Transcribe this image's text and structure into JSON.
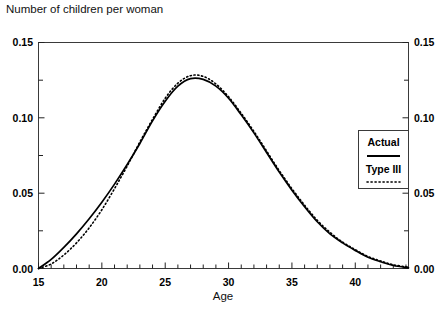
{
  "chart_data": {
    "type": "line",
    "title": "Number of children per woman",
    "xlabel": "Age",
    "ylabel": "",
    "xlim": [
      15,
      44.2
    ],
    "ylim": [
      0.0,
      0.15
    ],
    "grid": false,
    "legend_position": "right",
    "x_ticks": [
      15,
      20,
      25,
      30,
      35,
      40
    ],
    "x_tick_labels": [
      "15",
      "20",
      "25",
      "30",
      "35",
      "40"
    ],
    "x_minor_tick_step": 1,
    "y_ticks": [
      0.0,
      0.05,
      0.1,
      0.15
    ],
    "y_tick_labels": [
      "0.00",
      "0.05",
      "0.10",
      "0.15"
    ],
    "y_minor_ticks": [
      0.025,
      0.075,
      0.125
    ],
    "left_axis_labels": [
      "0.15",
      "0.10",
      "0.05",
      "0.00"
    ],
    "right_axis_labels": [
      "0.15",
      "0.10",
      "0.05",
      "0.00"
    ],
    "series": [
      {
        "name": "Actual",
        "style": "solid",
        "color": "#000000",
        "x": [
          15,
          16,
          17,
          18,
          19,
          20,
          21,
          22,
          23,
          24,
          25,
          26,
          27,
          28,
          29,
          30,
          31,
          32,
          33,
          34,
          35,
          36,
          37,
          38,
          39,
          40,
          41,
          42,
          43,
          44.2
        ],
        "values": [
          0.0,
          0.006,
          0.014,
          0.023,
          0.033,
          0.044,
          0.056,
          0.069,
          0.083,
          0.098,
          0.111,
          0.121,
          0.126,
          0.1255,
          0.121,
          0.113,
          0.102,
          0.09,
          0.077,
          0.064,
          0.052,
          0.041,
          0.031,
          0.023,
          0.017,
          0.012,
          0.0075,
          0.0045,
          0.002,
          0.0005
        ]
      },
      {
        "name": "Type III",
        "style": "dotted",
        "color": "#000000",
        "x": [
          15,
          16,
          17,
          18,
          19,
          20,
          21,
          22,
          23,
          24,
          25,
          26,
          27,
          28,
          29,
          30,
          31,
          32,
          33,
          34,
          35,
          36,
          37,
          38,
          39,
          40,
          41,
          42,
          43,
          44.2
        ],
        "values": [
          0.0,
          0.003,
          0.009,
          0.017,
          0.027,
          0.039,
          0.053,
          0.068,
          0.084,
          0.099,
          0.113,
          0.123,
          0.128,
          0.1275,
          0.1225,
          0.114,
          0.103,
          0.091,
          0.078,
          0.065,
          0.053,
          0.042,
          0.032,
          0.024,
          0.0175,
          0.0125,
          0.008,
          0.005,
          0.0025,
          0.0008
        ]
      }
    ],
    "annotations": []
  },
  "legend": {
    "items": [
      {
        "label": "Actual",
        "style": "solid"
      },
      {
        "label": "Type III",
        "style": "dotted"
      }
    ]
  }
}
